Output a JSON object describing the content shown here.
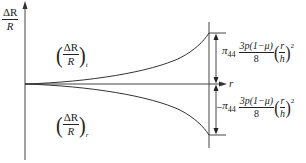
{
  "diagram": {
    "type": "resistance-change-vs-radius",
    "y_axis_label": {
      "numerator": "ΔR",
      "denominator": "R"
    },
    "x_axis_label": "r",
    "curves": [
      {
        "name": "tangential",
        "label_num": "ΔR",
        "label_den": "R",
        "subscript": "t",
        "direction": "up"
      },
      {
        "name": "radial",
        "label_num": "ΔR",
        "label_den": "R",
        "subscript": "r",
        "direction": "down"
      }
    ],
    "annotations": {
      "top": {
        "sign": "",
        "coef": "π",
        "coef_sub": "44",
        "frac_num": "3p(1−μ)",
        "frac_den": "8",
        "ratio_num": "r",
        "ratio_den": "h",
        "power": "2"
      },
      "bottom": {
        "sign": "−",
        "coef": "π",
        "coef_sub": "44",
        "frac_num": "3p(1−μ)",
        "frac_den": "8",
        "ratio_num": "r",
        "ratio_den": "h",
        "power": "2"
      }
    },
    "colors": {
      "line": "#333333",
      "background": "#ffffff"
    }
  }
}
